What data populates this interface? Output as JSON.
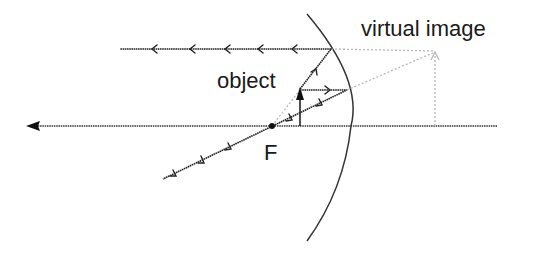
{
  "diagram": {
    "labels": {
      "object": "object",
      "virtual_image": "virtual image",
      "focal_point": "F"
    },
    "colors": {
      "ink": "#222222",
      "virtual_lines": "#b8b8b8",
      "background": "#ffffff"
    },
    "elements": {
      "principal_axis": {
        "from": [
          497,
          126
        ],
        "to": [
          28,
          126
        ],
        "arrow": "left"
      },
      "mirror": {
        "type": "convex-arc",
        "top": [
          307,
          14
        ],
        "axis_point": [
          351,
          126
        ],
        "bottom": [
          307,
          241
        ]
      },
      "focal_point": {
        "x": 272,
        "y": 126
      },
      "object_arrow": {
        "base": [
          300,
          126
        ],
        "tip": [
          300,
          89
        ]
      },
      "virtual_image_arrow": {
        "base": [
          435,
          126
        ],
        "tip": [
          435,
          52
        ],
        "style": "dotted-faint"
      },
      "rays": [
        {
          "name": "ray-through-focus-reflected-parallel",
          "points": [
            [
              300,
              89
            ],
            [
              331,
              49
            ],
            [
              120,
              49
            ]
          ],
          "arrows": 5
        },
        {
          "name": "ray-parallel-reflected-through-focus",
          "points": [
            [
              300,
              90
            ],
            [
              347,
              90
            ],
            [
              163,
              179
            ]
          ],
          "arrows": 5
        }
      ],
      "virtual_extensions": [
        {
          "from": [
            331,
            49
          ],
          "to": [
            435,
            52
          ]
        },
        {
          "from": [
            347,
            90
          ],
          "to": [
            435,
            52
          ]
        },
        {
          "from": [
            272,
            126
          ],
          "to": [
            300,
            89
          ]
        }
      ]
    }
  }
}
